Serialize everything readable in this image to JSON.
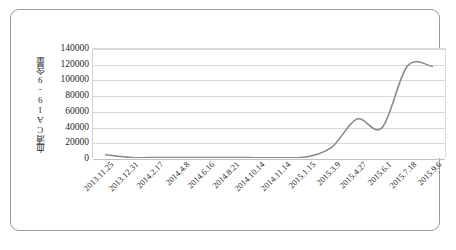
{
  "figure": {
    "border_color": "#9a9a9a",
    "background": "#ffffff"
  },
  "chart_data": {
    "type": "line",
    "title": "",
    "xlabel": "",
    "ylabel": "血清CA19-9含量",
    "ylim": [
      0,
      140000
    ],
    "ytick_values": [
      0,
      20000,
      40000,
      60000,
      80000,
      100000,
      120000,
      140000
    ],
    "ytick_labels": [
      "0",
      "20000",
      "40000",
      "60000",
      "80000",
      "100000",
      "120000",
      "140000"
    ],
    "grid": true,
    "grid_axis": "y",
    "legend": false,
    "line_color": "#8a8a8a",
    "categories": [
      "2013.11.25",
      "2013.12.31",
      "2014.2.17",
      "2014.4.8",
      "2014.6.16",
      "2014.8.21",
      "2014.10.14",
      "2014.11.14",
      "2015.1.15",
      "2015.3.9",
      "2015.4.27",
      "2015.6.1",
      "2015.7.18",
      "2015.9.6"
    ],
    "series": [
      {
        "name": "血清CA19-9含量",
        "values": [
          4200,
          700,
          500,
          600,
          500,
          700,
          400,
          300,
          1500,
          14000,
          50000,
          39000,
          118000,
          117500
        ]
      }
    ]
  }
}
